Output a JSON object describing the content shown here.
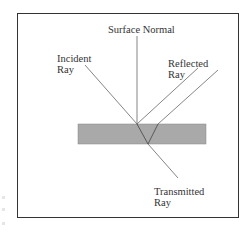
{
  "diagram": {
    "labels": {
      "surface_normal": "Surface Normal",
      "incident_line1": "Incident",
      "incident_line2": "Ray",
      "reflected_line1": "Reflected",
      "reflected_line2": "Ray",
      "transmitted_line1": "Transmitted",
      "transmitted_line2": "Ray"
    },
    "colors": {
      "slab_fill": "#a9a9a9",
      "line": "#555555",
      "frame": "#333333",
      "background": "#ffffff"
    }
  }
}
